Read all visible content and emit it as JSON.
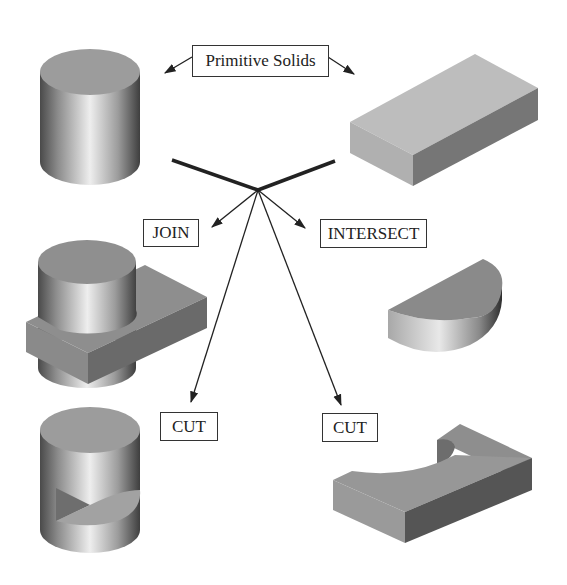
{
  "diagram": {
    "title": "Primitive Solids",
    "labels": {
      "primitive": "Primitive Solids",
      "join": "JOIN",
      "intersect": "INTERSECT",
      "cut_left": "CUT",
      "cut_right": "CUT"
    },
    "shapes": [
      {
        "name": "primitive-cylinder",
        "role": "primitive solid"
      },
      {
        "name": "primitive-box",
        "role": "primitive solid"
      },
      {
        "name": "join-result",
        "role": "JOIN result"
      },
      {
        "name": "intersect-result",
        "role": "INTERSECT result"
      },
      {
        "name": "cut-cylinder-result",
        "role": "CUT result (cylinder minus box)"
      },
      {
        "name": "cut-box-result",
        "role": "CUT result (box minus cylinder)"
      }
    ],
    "colors": {
      "line": "#222222",
      "top_face": "#9a9a9a",
      "box_light": "#b3b3b3",
      "box_dark": "#6e6e6e",
      "background": "#ffffff"
    }
  }
}
